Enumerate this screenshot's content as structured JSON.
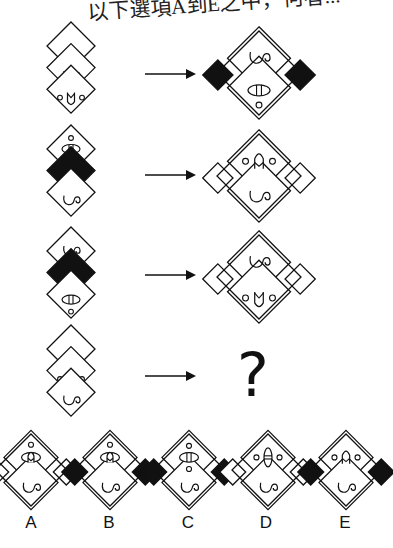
{
  "header": {
    "text": "以下選項A到E之中，何者..."
  },
  "question_mark": "?",
  "colors": {
    "stroke": "#111111",
    "fill_black": "#111111",
    "background": "#ffffff"
  },
  "rows": [
    {
      "id": 1,
      "input": [
        "blank",
        "swirl",
        "face-ovo-v"
      ],
      "output": {
        "top": "swirl",
        "bottom": "eye-h-dot",
        "sides": "black"
      }
    },
    {
      "id": 2,
      "input": [
        "dot-eye-dot",
        "black",
        "swirl"
      ],
      "output": {
        "top": "o-arch-o",
        "bottom": "swirl",
        "sides": "white"
      }
    },
    {
      "id": 3,
      "input": [
        "swirl",
        "black",
        "eye-h-dot"
      ],
      "output": {
        "top": "swirl",
        "bottom": "o-v-o",
        "sides": "white"
      }
    },
    {
      "id": 4,
      "input": [
        "blank",
        "face-ovo-v",
        "swirl"
      ],
      "output": "?"
    }
  ],
  "options": [
    {
      "label": "A",
      "top": "dot-eye-arch",
      "bottom": "swirl",
      "sides": "white"
    },
    {
      "label": "B",
      "top": "dot-eye-arch",
      "bottom": "swirl",
      "sides": "black"
    },
    {
      "label": "C",
      "top": "dot-eye-dot",
      "bottom": "swirl",
      "sides": "black"
    },
    {
      "label": "D",
      "top": "o-veye-o",
      "bottom": "swirl",
      "sides": "white"
    },
    {
      "label": "E",
      "top": "o-arch-o",
      "bottom": "swirl",
      "sides": "black"
    }
  ]
}
